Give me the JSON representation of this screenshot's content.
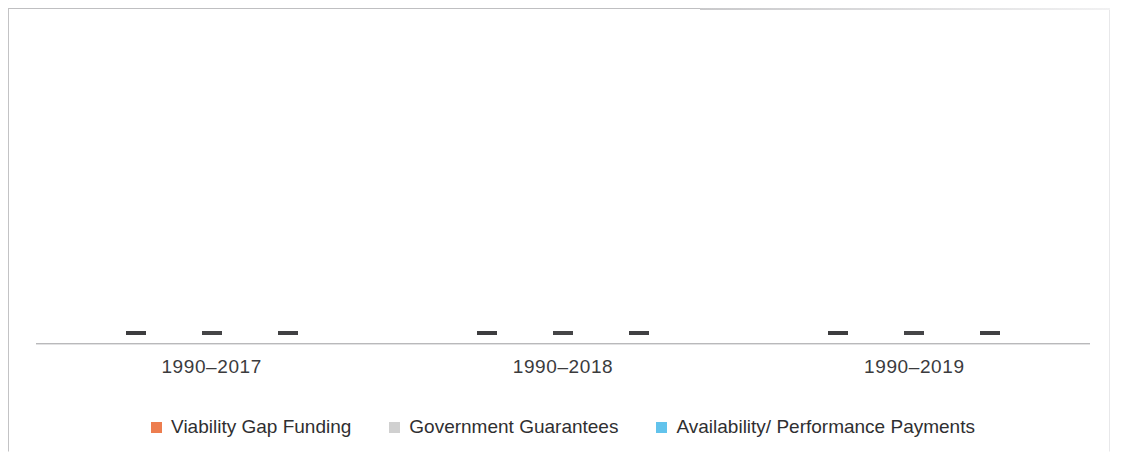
{
  "chart_data": {
    "type": "bar",
    "title": "",
    "subtitle": "",
    "xlabel": "",
    "ylabel": "",
    "categories": [
      "1990–2017",
      "1990–2018",
      "1990–2019"
    ],
    "series": [
      {
        "name": "Viability Gap Funding",
        "color": "#ED7D4F",
        "values": [
          0,
          0,
          0
        ]
      },
      {
        "name": "Government Guarantees",
        "color": "#D0D0D0",
        "values": [
          0,
          0,
          0
        ]
      },
      {
        "name": "Availability/ Performance Payments",
        "color": "#62C3EC",
        "values": [
          0,
          0,
          0
        ]
      }
    ],
    "ylim": [
      0,
      1
    ],
    "grid": false,
    "legend_position": "bottom"
  },
  "axis": {
    "tick_labels": [
      "1990–2017",
      "1990–2018",
      "1990–2019"
    ],
    "baseline_color": "#b9b9bb"
  },
  "legend": {
    "items": [
      {
        "label": "Viability Gap Funding",
        "color": "#ED7D4F"
      },
      {
        "label": "Government Guarantees",
        "color": "#D0D0D0"
      },
      {
        "label": "Availability/ Performance Payments",
        "color": "#62C3EC"
      }
    ]
  },
  "bars": {
    "groups": [
      {
        "marks": [
          {
            "series": 0
          },
          {
            "series": 1
          },
          {
            "series": 2
          }
        ]
      },
      {
        "marks": [
          {
            "series": 0
          },
          {
            "series": 1
          },
          {
            "series": 2
          }
        ]
      },
      {
        "marks": [
          {
            "series": 0
          },
          {
            "series": 1
          },
          {
            "series": 2
          }
        ]
      }
    ]
  }
}
